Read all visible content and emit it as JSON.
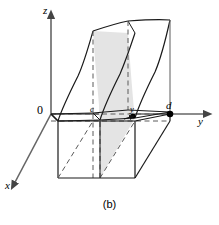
{
  "figure": {
    "caption": "(b)",
    "axes": {
      "z_label": "z",
      "y_label": "y",
      "x_label": "x",
      "origin_label": "0"
    },
    "marked_points": [
      {
        "id": "c",
        "label": "c",
        "description": "near endpoint of interval on y-axis"
      },
      {
        "id": "y",
        "label": "y",
        "description": "slice position on y-axis"
      },
      {
        "id": "d",
        "label": "d",
        "description": "far endpoint of interval on y-axis"
      }
    ],
    "colors": {
      "line": "#1a1a1a",
      "axis": "#555555",
      "hidden_line": "#555555",
      "shaded_slice": "#e2e2e2",
      "background": "#ffffff",
      "point_fill": "#000000"
    },
    "geometry_notes": {
      "type": "solid-under-surface",
      "slice_shading": "gray cross-section at y",
      "hidden_edges": "dashed"
    }
  }
}
